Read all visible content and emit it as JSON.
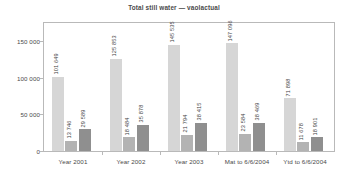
{
  "chart_data": {
    "type": "bar",
    "title": "Total still water — vaolactual",
    "xlabel": "",
    "ylabel": "",
    "categories": [
      "Year 2001",
      "Year 2002",
      "Year 2003",
      "Mat to 6/6/2004",
      "Ytd to 6/6/2004"
    ],
    "series": [
      {
        "name": "series-1",
        "color": "#d6d6d6",
        "values": [
          101649,
          125853,
          145535,
          147096,
          71898
        ],
        "labels": [
          "101 649",
          "125 853",
          "145 535",
          "147 096",
          "71 898"
        ]
      },
      {
        "name": "series-2",
        "color": "#b3b3b3",
        "values": [
          13746,
          18484,
          21794,
          23584,
          11678
        ],
        "labels": [
          "13 746",
          "18 484",
          "21 794",
          "23 584",
          "11 678"
        ]
      },
      {
        "name": "series-3",
        "color": "#8f8f8f",
        "values": [
          29589,
          35878,
          38415,
          38469,
          18901
        ],
        "labels": [
          "29 589",
          "35 878",
          "38 415",
          "38 469",
          "18 901"
        ]
      }
    ],
    "ylim": [
      0,
      175000
    ],
    "yticks": [
      0,
      50000,
      100000,
      150000
    ],
    "ytick_labels": [
      "0",
      "50 000",
      "100 000",
      "150 000"
    ],
    "grid": false,
    "legend": "none",
    "frame_color": "#b9b9b9",
    "background": "#ffffff"
  }
}
